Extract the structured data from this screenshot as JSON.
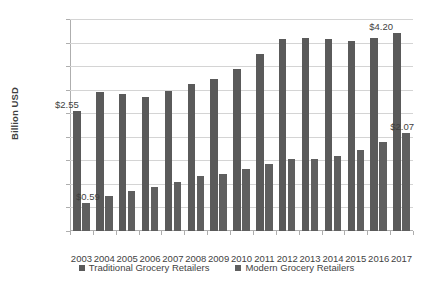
{
  "chart_data": {
    "type": "bar",
    "title": "",
    "xlabel": "",
    "ylabel": "Billion USD",
    "ylim": [
      0,
      4.5
    ],
    "ytick_step": 0.5,
    "grid": true,
    "legend_position": "bottom",
    "categories": [
      "2003",
      "2004",
      "2005",
      "2006",
      "2007",
      "2008",
      "2009",
      "2010",
      "2011",
      "2012",
      "2013",
      "2014",
      "2015",
      "2016",
      "2017"
    ],
    "ytick_labels": [
      "$0.00",
      "$0.50",
      "$1.00",
      "$1.50",
      "$2.00",
      "$2.50",
      "$3.00",
      "$3.50",
      "$4.00",
      "$4.50"
    ],
    "ytick_values": [
      0,
      0.5,
      1,
      1.5,
      2,
      2.5,
      3,
      3.5,
      4,
      4.5
    ],
    "series": [
      {
        "name": "Traditional Grocery Retailers",
        "color": "#5a5a5a",
        "values": [
          2.55,
          2.95,
          2.9,
          2.85,
          2.97,
          3.13,
          3.22,
          3.44,
          3.75,
          4.07,
          4.1,
          4.07,
          4.03,
          4.1,
          4.2
        ]
      },
      {
        "name": "Modern Grocery Retailers",
        "color": "#5f5f5f",
        "values": [
          0.59,
          0.74,
          0.84,
          0.94,
          1.04,
          1.17,
          1.22,
          1.32,
          1.42,
          1.53,
          1.53,
          1.6,
          1.72,
          1.89,
          2.07
        ]
      }
    ],
    "annotations": [
      {
        "label": "$2.55",
        "series": "Traditional Grocery Retailers",
        "category": "2003",
        "value": 2.55
      },
      {
        "label": "$0.59",
        "series": "Modern Grocery Retailers",
        "category": "2003",
        "value": 0.59
      },
      {
        "label": "$4.20",
        "series": "Traditional Grocery Retailers",
        "category": "2017",
        "value": 4.2
      },
      {
        "label": "$2.07",
        "series": "Modern Grocery Retailers",
        "category": "2017",
        "value": 2.07
      }
    ]
  }
}
